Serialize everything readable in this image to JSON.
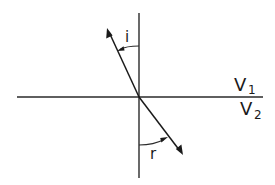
{
  "diagram": {
    "title": "",
    "type": "refraction-at-interface",
    "labels": {
      "incidence_angle": "i",
      "refraction_angle": "r",
      "upper_medium": {
        "letter": "V",
        "subscript": "1"
      },
      "lower_medium": {
        "letter": "V",
        "subscript": "2"
      }
    },
    "elements": [
      {
        "id": "interface",
        "kind": "horizontal-line",
        "description": "boundary between media"
      },
      {
        "id": "normal",
        "kind": "vertical-line",
        "description": "normal to interface"
      },
      {
        "id": "incident-ray",
        "kind": "arrow",
        "description": "ray in upper medium, arrowhead pointing up-left"
      },
      {
        "id": "refracted-ray",
        "kind": "arrow",
        "description": "ray in lower medium, arrowhead pointing down-right"
      },
      {
        "id": "angle-i-arc",
        "kind": "arc-with-arrow",
        "label": "i"
      },
      {
        "id": "angle-r-arc",
        "kind": "arc-with-arrow",
        "label": "r"
      }
    ],
    "colors": {
      "ink": "#1a1a1a",
      "background": "#ffffff"
    }
  }
}
